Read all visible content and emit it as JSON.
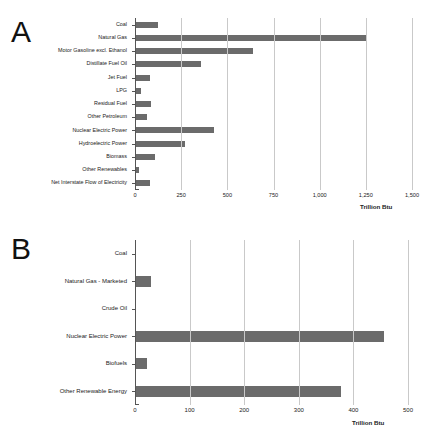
{
  "figure": {
    "panels": [
      {
        "letter": "A",
        "axis_title": "Trillion Btu",
        "xticks": [
          "0",
          "250",
          "500",
          "750",
          "1,000",
          "1,250",
          "1,500"
        ]
      },
      {
        "letter": "B",
        "axis_title": "Trillion Btu",
        "xticks": [
          "0",
          "100",
          "200",
          "300",
          "400",
          "500"
        ]
      }
    ]
  },
  "chart_data": [
    {
      "type": "bar",
      "title": "A",
      "orientation": "horizontal",
      "categories": [
        "Coal",
        "Natural Gas",
        "Motor Gasoline excl. Ethanol",
        "Distillate Fuel Oil",
        "Jet Fuel",
        "LPG",
        "Residual Fuel",
        "Other Petroleum",
        "Nuclear Electric Power",
        "Hydroelectric Power",
        "Biomass",
        "Other Renewables",
        "Net Interstate Flow of Electricity"
      ],
      "values": [
        118,
        1250,
        632,
        350,
        77,
        26,
        80,
        62,
        424,
        265,
        104,
        18,
        77
      ],
      "xlabel": "Trillion Btu",
      "ylabel": "",
      "xlim": [
        0,
        1500
      ],
      "xticks": [
        0,
        250,
        500,
        750,
        1000,
        1250,
        1500
      ],
      "xticklabels": [
        "0",
        "250",
        "500",
        "750",
        "1,000",
        "1,250",
        "1,500"
      ],
      "grid": true,
      "legend": "none",
      "bar_color": "#6b6b6b"
    },
    {
      "type": "bar",
      "title": "B",
      "orientation": "horizontal",
      "categories": [
        "Coal",
        "Natural Gas - Marketed",
        "Crude Oil",
        "Nuclear Electric Power",
        "Biofuels",
        "Other Renewable Energy"
      ],
      "values": [
        0,
        28,
        0,
        454,
        21,
        376
      ],
      "xlabel": "Trillion Btu",
      "ylabel": "",
      "xlim": [
        0,
        500
      ],
      "xticks": [
        0,
        100,
        200,
        300,
        400,
        500
      ],
      "xticklabels": [
        "0",
        "100",
        "200",
        "300",
        "400",
        "500"
      ],
      "grid": true,
      "legend": "none",
      "bar_color": "#6b6b6b"
    }
  ]
}
